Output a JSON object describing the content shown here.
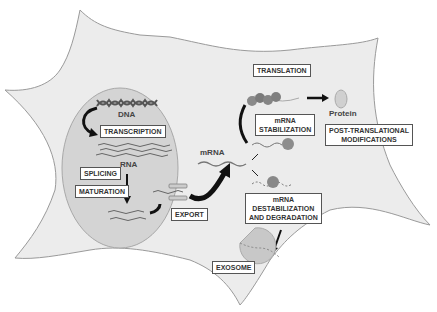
{
  "diagram": {
    "nodes": {
      "dna": "DNA",
      "transcription": "TRANSCRIPTION",
      "rna": "RNA",
      "splicing": "SPLICING",
      "maturation": "MATURATION",
      "export": "EXPORT",
      "mrna": "mRNA",
      "translation": "TRANSLATION",
      "mrna_stabilization_1": "mRNA",
      "mrna_stabilization_2": "STABILIZATION",
      "protein": "Protein",
      "ptm_1": "POST-TRANSLATIONAL",
      "ptm_2": "MODIFICATIONS",
      "destab_1": "mRNA",
      "destab_2": "DESTABILIZATION",
      "destab_3": "AND DEGRADATION",
      "exosome": "EXOSOME"
    },
    "colors": {
      "cell": "#ececec",
      "cell_border": "#999999",
      "nucleus": "#d6d6d6",
      "nucleus_border": "#aaaaaa",
      "arrow": "#111111",
      "rna_strand": "#777777"
    }
  }
}
